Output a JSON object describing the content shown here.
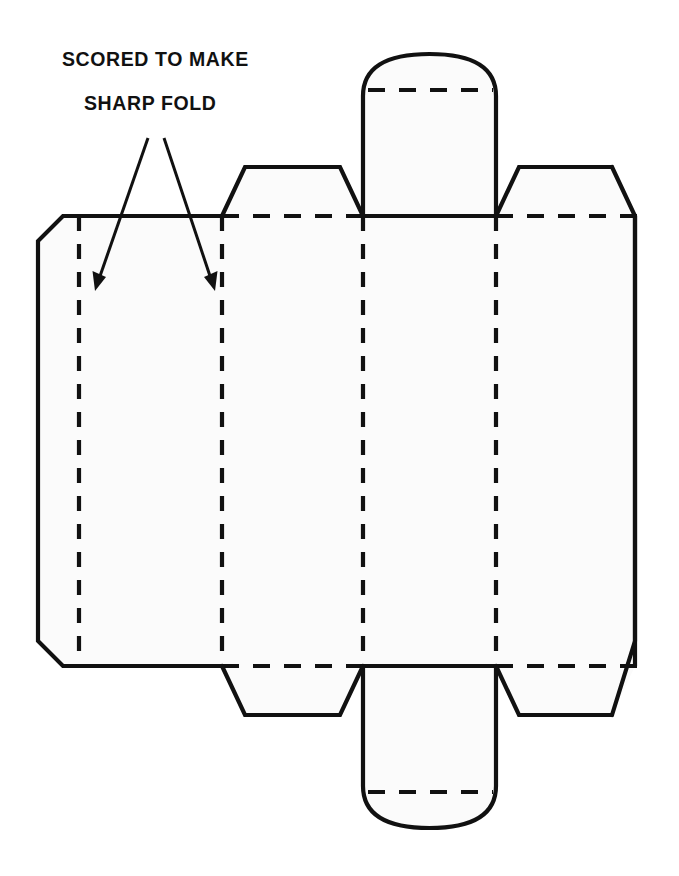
{
  "document": {
    "type": "technical-diagram",
    "subject": "carton-blank-die-cut-layout",
    "background_color": "#ffffff",
    "line_color": "#111111",
    "panel_fill_color": "#fbfbfb"
  },
  "annotations": {
    "callout": {
      "name": "scored-fold-callout",
      "line1": "SCORED  TO MAKE",
      "line2": "SHARP FOLD",
      "line1_x": 62,
      "line1_y": 66,
      "line2_x": 84,
      "line2_y": 110,
      "arrows": [
        {
          "name": "arrow-to-left-score-line",
          "from_x": 148,
          "from_y": 138,
          "to_x": 95,
          "to_y": 288,
          "points_to": "left-vertical-score-line"
        },
        {
          "name": "arrow-to-second-score-line",
          "from_x": 164,
          "from_y": 138,
          "to_x": 215,
          "to_y": 288,
          "points_to": "second-vertical-score-line"
        }
      ]
    }
  },
  "geometry": {
    "body": {
      "name": "main-body-outline",
      "top_y": 216,
      "bottom_y": 666,
      "left_x": 38,
      "right_x": 635,
      "chamfer": 25
    },
    "vertical_score_lines": [
      {
        "name": "score-line-1",
        "x": 79,
        "y1": 216,
        "y2": 666
      },
      {
        "name": "score-line-2",
        "x": 222,
        "y1": 216,
        "y2": 666
      },
      {
        "name": "score-line-3",
        "x": 363,
        "y1": 216,
        "y2": 666
      },
      {
        "name": "score-line-4",
        "x": 496,
        "y1": 216,
        "y2": 666
      }
    ],
    "horizontal_score_segments": [
      {
        "name": "top-score-segment-left",
        "x1": 222,
        "x2": 363,
        "y": 216
      },
      {
        "name": "top-score-segment-right",
        "x1": 496,
        "x2": 635,
        "y": 216
      },
      {
        "name": "bottom-score-segment-left",
        "x1": 222,
        "x2": 363,
        "y": 666
      },
      {
        "name": "bottom-score-segment-right",
        "x1": 496,
        "x2": 635,
        "y": 666
      }
    ],
    "flaps": [
      {
        "name": "top-left-trapezoid-flap",
        "base_x1": 222,
        "base_x2": 363,
        "top_x1": 245,
        "top_x2": 340,
        "base_y": 216,
        "top_y": 167
      },
      {
        "name": "top-right-trapezoid-flap",
        "base_x1": 496,
        "base_x2": 635,
        "top_x1": 519,
        "top_x2": 612,
        "base_y": 216,
        "top_y": 167
      },
      {
        "name": "bottom-left-trapezoid-flap",
        "base_x1": 222,
        "base_x2": 363,
        "top_x1": 245,
        "top_x2": 340,
        "base_y": 666,
        "top_y": 715
      },
      {
        "name": "bottom-right-trapezoid-flap",
        "base_x1": 496,
        "base_x2": 635,
        "top_x1": 519,
        "top_x2": 612,
        "base_y": 666,
        "top_y": 715
      }
    ],
    "tabs": [
      {
        "name": "top-center-domed-tab",
        "left_x": 363,
        "right_x": 496,
        "base_y": 216,
        "fold_y": 90,
        "apex_y": 54,
        "fold_line": "dashed"
      },
      {
        "name": "bottom-center-domed-tab",
        "left_x": 363,
        "right_x": 496,
        "base_y": 666,
        "fold_y": 792,
        "apex_y": 828,
        "fold_line": "dashed"
      }
    ]
  }
}
